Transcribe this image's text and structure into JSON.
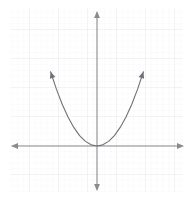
{
  "figure": {
    "title": "",
    "width": 192,
    "height": 203,
    "background_color": "#ffffff"
  },
  "grid": {
    "show": true,
    "minor_color": "#f2f2f3",
    "major_color": "#e8e8ea",
    "minor_spacing_px": 5.8,
    "major_spacing_px": 29,
    "left_px": 12,
    "right_px": 182,
    "top_px": 10,
    "bottom_px": 192
  },
  "axes": {
    "color": "#8a8a90",
    "stroke_width": 1.1,
    "origin_x_px": 97,
    "origin_y_px": 146,
    "x_axis": {
      "label": "",
      "left_arrow_tip_px": 11,
      "right_arrow_tip_px": 184,
      "arrowheads": "both",
      "tick_labels": []
    },
    "y_axis": {
      "label": "",
      "top_arrow_tip_px": 11,
      "bottom_arrow_tip_px": 191,
      "arrowheads": "both",
      "tick_labels": []
    }
  },
  "chart_data": {
    "type": "line",
    "title": "",
    "subtitle": "",
    "xlabel": "",
    "ylabel": "",
    "grid": true,
    "legend": null,
    "legend_position": "none",
    "xlim": [
      -3.0,
      3.0
    ],
    "ylim": [
      -1.6,
      4.7
    ],
    "x_unit_px": 29,
    "y_unit_px": 29,
    "series": [
      {
        "name": "y = x^2",
        "curve_type": "parabola",
        "color": "#70707a",
        "stroke_width": 1.1,
        "vertex": [
          0,
          0
        ],
        "leading_coefficient": 1,
        "opens": "up",
        "arrowheads": "both-ends",
        "x": [
          -1.6,
          -1.4,
          -1.2,
          -1.0,
          -0.8,
          -0.6,
          -0.4,
          -0.2,
          0.0,
          0.2,
          0.4,
          0.6,
          0.8,
          1.0,
          1.2,
          1.4,
          1.6
        ],
        "y": [
          2.56,
          1.96,
          1.44,
          1.0,
          0.64,
          0.36,
          0.16,
          0.04,
          0.0,
          0.04,
          0.16,
          0.36,
          0.64,
          1.0,
          1.44,
          1.96,
          2.56
        ],
        "endpoint_left_px": [
          71,
          68
        ],
        "endpoint_right_px": [
          122,
          68
        ],
        "vertex_px": [
          97,
          146
        ]
      }
    ],
    "annotations": []
  }
}
